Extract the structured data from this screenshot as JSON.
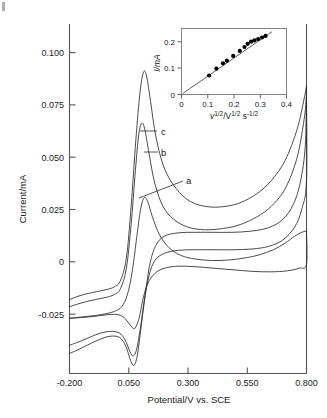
{
  "figure": {
    "title": "",
    "corner_marker": ""
  },
  "main_axes": {
    "xlabel": "Potential/V vs. SCE",
    "ylabel": "Current/mA",
    "xticks": [
      "-0.200",
      "0.050",
      "0.300",
      "0.550",
      "0.800"
    ],
    "xtick_values": [
      -0.2,
      0.05,
      0.3,
      0.55,
      0.8
    ],
    "yticks": [
      "0.100",
      "0.075",
      "0.050",
      "0.025",
      "0",
      "-0.025"
    ],
    "ytick_values": [
      0.1,
      0.075,
      0.05,
      0.025,
      0,
      -0.025
    ]
  },
  "curve_labels": [
    {
      "id": "a",
      "text": "a"
    },
    {
      "id": "b",
      "text": "b"
    },
    {
      "id": "c",
      "text": "c"
    }
  ],
  "inset": {
    "xlabel_base": "v",
    "xlabel_sup1": "1/2",
    "xlabel_mid": "/V",
    "xlabel_sup2": "1/2",
    "xlabel_tail": " s",
    "xlabel_sup3": "-1/2",
    "ylabel": "I/mA",
    "xticks": [
      "0",
      "0.1",
      "0.2",
      "0.3",
      "0.4"
    ],
    "xtick_values": [
      0,
      0.1,
      0.2,
      0.3,
      0.4
    ],
    "yticks": [
      "0",
      "0.1",
      "0.2"
    ],
    "ytick_values": [
      0,
      0.1,
      0.2
    ]
  },
  "chart_data": {
    "type": "line",
    "xlabel": "Potential/V vs. SCE",
    "ylabel": "Current/mA",
    "xlim": [
      -0.2,
      0.8
    ],
    "ylim": [
      -0.025,
      0.11
    ],
    "grid": false,
    "legend": "inline curve labels a, b, c",
    "series": [
      {
        "name": "a",
        "comment": "lowest scan rate; anodic peak ~0.0435 mA near 0.115 V",
        "anodic_peak_current": 0.0435,
        "anodic_peak_potential": 0.115,
        "cathodic_peak_current": -0.0075,
        "cathodic_peak_potential": 0.02,
        "forward": [
          [
            -0.2,
            -0.0035
          ],
          [
            -0.17,
            -0.0032
          ],
          [
            -0.13,
            -0.0028
          ],
          [
            -0.09,
            -0.0024
          ],
          [
            -0.05,
            -0.0018
          ],
          [
            -0.01,
            -0.0008
          ],
          [
            0.02,
            0.001
          ],
          [
            0.045,
            0.006
          ],
          [
            0.065,
            0.015
          ],
          [
            0.085,
            0.029
          ],
          [
            0.1,
            0.039
          ],
          [
            0.115,
            0.0435
          ],
          [
            0.13,
            0.042
          ],
          [
            0.15,
            0.036
          ],
          [
            0.18,
            0.029
          ],
          [
            0.22,
            0.024
          ],
          [
            0.27,
            0.021
          ],
          [
            0.33,
            0.0196
          ],
          [
            0.4,
            0.019
          ],
          [
            0.47,
            0.0192
          ],
          [
            0.54,
            0.02
          ],
          [
            0.6,
            0.0212
          ],
          [
            0.66,
            0.0232
          ],
          [
            0.71,
            0.0258
          ],
          [
            0.75,
            0.0285
          ],
          [
            0.78,
            0.03
          ],
          [
            0.8,
            0.0305
          ]
        ],
        "reverse": [
          [
            0.8,
            0.0305
          ],
          [
            0.8,
            0.0175
          ],
          [
            0.77,
            0.016
          ],
          [
            0.72,
            0.015
          ],
          [
            0.65,
            0.0146
          ],
          [
            0.57,
            0.0148
          ],
          [
            0.49,
            0.0154
          ],
          [
            0.41,
            0.016
          ],
          [
            0.33,
            0.0166
          ],
          [
            0.26,
            0.0168
          ],
          [
            0.2,
            0.016
          ],
          [
            0.16,
            0.014
          ],
          [
            0.13,
            0.01
          ],
          [
            0.11,
            0.004
          ],
          [
            0.095,
            -0.003
          ],
          [
            0.08,
            -0.0068
          ],
          [
            0.07,
            -0.0075
          ],
          [
            0.055,
            -0.006
          ],
          [
            0.03,
            -0.0032
          ],
          [
            0.0,
            -0.002
          ],
          [
            -0.05,
            -0.0022
          ],
          [
            -0.1,
            -0.0028
          ],
          [
            -0.15,
            -0.0032
          ],
          [
            -0.2,
            -0.0035
          ]
        ]
      },
      {
        "name": "b",
        "comment": "middle scan rate; anodic peak ~0.0725 mA near 0.105 V",
        "anodic_peak_current": 0.0725,
        "anodic_peak_potential": 0.105,
        "cathodic_peak_current": -0.0182,
        "cathodic_peak_potential": 0.055,
        "forward": [
          [
            -0.2,
            0.001
          ],
          [
            -0.16,
            0.0022
          ],
          [
            -0.12,
            0.0032
          ],
          [
            -0.08,
            0.004
          ],
          [
            -0.04,
            0.0048
          ],
          [
            -0.01,
            0.0058
          ],
          [
            0.015,
            0.008
          ],
          [
            0.04,
            0.016
          ],
          [
            0.06,
            0.033
          ],
          [
            0.078,
            0.054
          ],
          [
            0.092,
            0.068
          ],
          [
            0.105,
            0.0725
          ],
          [
            0.118,
            0.07
          ],
          [
            0.135,
            0.061
          ],
          [
            0.16,
            0.049
          ],
          [
            0.195,
            0.04
          ],
          [
            0.24,
            0.035
          ],
          [
            0.3,
            0.032
          ],
          [
            0.37,
            0.031
          ],
          [
            0.45,
            0.0315
          ],
          [
            0.52,
            0.033
          ],
          [
            0.59,
            0.036
          ],
          [
            0.65,
            0.04
          ],
          [
            0.71,
            0.047
          ],
          [
            0.76,
            0.059
          ],
          [
            0.79,
            0.074
          ],
          [
            0.8,
            0.083
          ]
        ],
        "reverse": [
          [
            0.8,
            0.083
          ],
          [
            0.8,
            0.05
          ],
          [
            0.78,
            0.039
          ],
          [
            0.75,
            0.032
          ],
          [
            0.7,
            0.027
          ],
          [
            0.64,
            0.0245
          ],
          [
            0.57,
            0.0235
          ],
          [
            0.49,
            0.0232
          ],
          [
            0.41,
            0.0232
          ],
          [
            0.33,
            0.0232
          ],
          [
            0.26,
            0.023
          ],
          [
            0.2,
            0.0218
          ],
          [
            0.16,
            0.019
          ],
          [
            0.135,
            0.013
          ],
          [
            0.115,
            0.003
          ],
          [
            0.098,
            -0.008
          ],
          [
            0.082,
            -0.016
          ],
          [
            0.068,
            -0.0182
          ],
          [
            0.055,
            -0.0165
          ],
          [
            0.035,
            -0.012
          ],
          [
            0.01,
            -0.0092
          ],
          [
            -0.03,
            -0.0086
          ],
          [
            -0.08,
            -0.0096
          ],
          [
            -0.13,
            -0.0115
          ],
          [
            -0.17,
            -0.013
          ],
          [
            -0.2,
            -0.014
          ]
        ]
      },
      {
        "name": "c",
        "comment": "highest scan rate; anodic peak ~0.0925 mA near 0.115 V",
        "anodic_peak_current": 0.0925,
        "anodic_peak_potential": 0.115,
        "cathodic_peak_current": -0.0218,
        "cathodic_peak_potential": 0.058,
        "forward": [
          [
            -0.2,
            0.0038
          ],
          [
            -0.16,
            0.0052
          ],
          [
            -0.12,
            0.0062
          ],
          [
            -0.08,
            0.007
          ],
          [
            -0.04,
            0.0078
          ],
          [
            -0.01,
            0.0088
          ],
          [
            0.015,
            0.0112
          ],
          [
            0.04,
            0.02
          ],
          [
            0.06,
            0.04
          ],
          [
            0.08,
            0.066
          ],
          [
            0.098,
            0.085
          ],
          [
            0.113,
            0.0925
          ],
          [
            0.126,
            0.0905
          ],
          [
            0.142,
            0.081
          ],
          [
            0.165,
            0.067
          ],
          [
            0.2,
            0.055
          ],
          [
            0.25,
            0.047
          ],
          [
            0.31,
            0.042
          ],
          [
            0.38,
            0.04
          ],
          [
            0.45,
            0.04
          ],
          [
            0.52,
            0.0415
          ],
          [
            0.59,
            0.045
          ],
          [
            0.65,
            0.05
          ],
          [
            0.71,
            0.058
          ],
          [
            0.76,
            0.07
          ],
          [
            0.79,
            0.082
          ],
          [
            0.8,
            0.087
          ]
        ],
        "reverse": [
          [
            0.8,
            0.087
          ],
          [
            0.795,
            0.064
          ],
          [
            0.775,
            0.05
          ],
          [
            0.745,
            0.041
          ],
          [
            0.7,
            0.035
          ],
          [
            0.64,
            0.0318
          ],
          [
            0.57,
            0.0305
          ],
          [
            0.49,
            0.03
          ],
          [
            0.41,
            0.03
          ],
          [
            0.33,
            0.03
          ],
          [
            0.26,
            0.0298
          ],
          [
            0.2,
            0.0285
          ],
          [
            0.165,
            0.025
          ],
          [
            0.14,
            0.018
          ],
          [
            0.12,
            0.006
          ],
          [
            0.102,
            -0.007
          ],
          [
            0.086,
            -0.018
          ],
          [
            0.072,
            -0.0218
          ],
          [
            0.058,
            -0.02
          ],
          [
            0.038,
            -0.0145
          ],
          [
            0.012,
            -0.011
          ],
          [
            -0.03,
            -0.0105
          ],
          [
            -0.08,
            -0.012
          ],
          [
            -0.13,
            -0.0142
          ],
          [
            -0.17,
            -0.016
          ],
          [
            -0.2,
            -0.0172
          ]
        ]
      }
    ],
    "inset_chart": {
      "type": "scatter",
      "title": "",
      "xlabel": "v^1/2 / V^1/2 s^-1/2",
      "ylabel": "I/mA",
      "xlim": [
        0,
        0.4
      ],
      "ylim": [
        0,
        0.25
      ],
      "grid": false,
      "points": [
        [
          0.105,
          0.072
        ],
        [
          0.133,
          0.098
        ],
        [
          0.158,
          0.118
        ],
        [
          0.173,
          0.128
        ],
        [
          0.197,
          0.146
        ],
        [
          0.222,
          0.165
        ],
        [
          0.24,
          0.18
        ],
        [
          0.252,
          0.192
        ],
        [
          0.265,
          0.2
        ],
        [
          0.278,
          0.205
        ],
        [
          0.292,
          0.21
        ],
        [
          0.307,
          0.216
        ],
        [
          0.32,
          0.222
        ]
      ],
      "fit_line": {
        "x": [
          0.005,
          0.345
        ],
        "y": [
          0.004,
          0.238
        ],
        "slope": 0.688,
        "intercept": 0.0006
      }
    }
  }
}
